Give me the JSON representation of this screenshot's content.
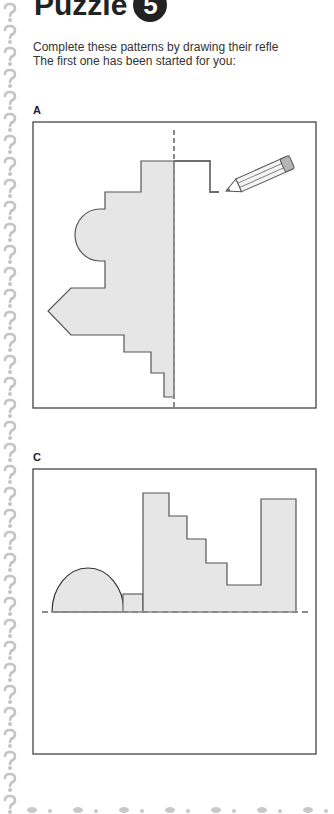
{
  "page": {
    "title": "Puzzle",
    "puzzle_number": "5",
    "instructions": {
      "line1": "Complete these patterns by drawing their refle",
      "line2": "The first one has been started for you:"
    }
  },
  "figures": [
    {
      "label": "A",
      "axis": "vertical",
      "note": "reflection started with pencil line"
    },
    {
      "label": "C",
      "axis": "horizontal"
    }
  ],
  "colors": {
    "shape_fill": "#e6e6e6",
    "shape_stroke": "#555555",
    "axis_dash": "#8a8a8a",
    "frame": "#444444",
    "border_glyph": "#c4c4c4"
  },
  "decor": {
    "border_icon": "question-mark-icon"
  }
}
